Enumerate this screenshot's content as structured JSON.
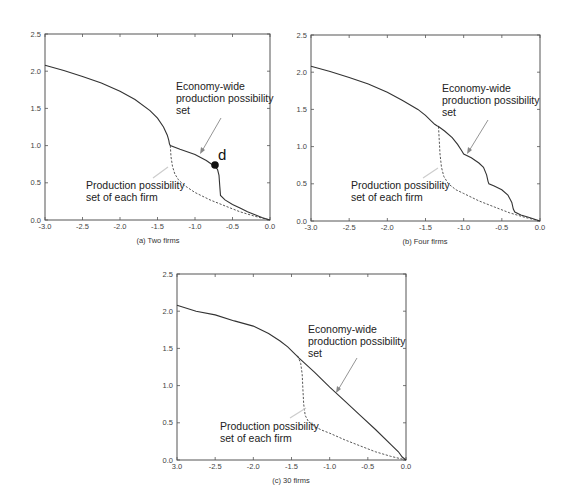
{
  "figure": {
    "panels": [
      {
        "id": "a",
        "caption": "(a) Two firms",
        "annotation_top": [
          "Economy-wide",
          "production possibility",
          "set"
        ],
        "annotation_bottom": [
          "Production possibility",
          "set of each firm"
        ],
        "point_label": "d",
        "x_tick_labels": [
          "-3.0",
          "-2.5",
          "-2.0",
          "-1.5",
          "-1.0",
          "-0.5",
          "0.0"
        ],
        "y_tick_labels": [
          "0.0",
          "0.5",
          "1.0",
          "1.5",
          "2.0",
          "2.5"
        ]
      },
      {
        "id": "b",
        "caption": "(b) Four firms",
        "annotation_top": [
          "Economy-wide",
          "production possibility",
          "set"
        ],
        "annotation_bottom": [
          "Production possibility",
          "set of each firm"
        ],
        "x_tick_labels": [
          "-3.0",
          "-2.5",
          "-2.0",
          "-1.5",
          "-1.0",
          "-0.5",
          "0.0"
        ],
        "y_tick_labels": [
          "0.0",
          "0.5",
          "1.0",
          "1.5",
          "2.0",
          "2.5"
        ]
      },
      {
        "id": "c",
        "caption": "(c) 30 firms",
        "annotation_top": [
          "Economy-wide",
          "production possibility",
          "set"
        ],
        "annotation_bottom": [
          "Production possibility",
          "set of each firm"
        ],
        "x_tick_labels": [
          "3.0",
          "-2.5",
          "-2.0",
          "-1.5",
          "-1.0",
          "-0.5",
          "0.0"
        ],
        "y_tick_labels": [
          "0.0",
          "0.5",
          "1.0",
          "1.5",
          "2.0",
          "2.5"
        ]
      }
    ]
  },
  "chart_data": [
    {
      "type": "line",
      "title": "(a) Two firms",
      "xlabel": "",
      "ylabel": "",
      "xlim": [
        -3.0,
        0.0
      ],
      "ylim": [
        0.0,
        2.5
      ],
      "grid": false,
      "series": [
        {
          "name": "Economy-wide production possibility set",
          "style": "solid",
          "x": [
            -3.0,
            -2.75,
            -2.5,
            -2.25,
            -2.0,
            -1.8,
            -1.6,
            -1.5,
            -1.42,
            -1.37,
            -1.35,
            -1.34,
            -1.33,
            -1.2,
            -1.0,
            -0.85,
            -0.75,
            -0.7,
            -0.68,
            -0.67,
            -0.66,
            -0.6,
            -0.5,
            -0.4,
            -0.3,
            -0.2,
            -0.1,
            0.0
          ],
          "y": [
            2.08,
            2.01,
            1.93,
            1.84,
            1.73,
            1.62,
            1.47,
            1.37,
            1.25,
            1.14,
            1.07,
            1.02,
            1.0,
            0.95,
            0.88,
            0.8,
            0.73,
            0.68,
            0.6,
            0.45,
            0.33,
            0.27,
            0.21,
            0.16,
            0.11,
            0.07,
            0.03,
            0.0
          ]
        },
        {
          "name": "Production possibility set of each firm",
          "style": "dashed",
          "x": [
            -1.33,
            -1.32,
            -1.3,
            -1.27,
            -1.22,
            -1.15,
            -1.0,
            -0.8,
            -0.6,
            -0.4,
            -0.2,
            0.0
          ],
          "y": [
            1.0,
            0.85,
            0.72,
            0.62,
            0.54,
            0.47,
            0.37,
            0.27,
            0.19,
            0.11,
            0.05,
            0.0
          ]
        }
      ],
      "annotations": [
        {
          "text": "Economy-wide production possibility set",
          "arrow_to": [
            -0.92,
            0.86
          ]
        },
        {
          "text": "Production possibility set of each firm",
          "arrow_to": [
            -1.33,
            0.72
          ]
        },
        {
          "text": "d",
          "point": [
            -0.74,
            0.73
          ]
        }
      ]
    },
    {
      "type": "line",
      "title": "(b) Four firms",
      "xlabel": "",
      "ylabel": "",
      "xlim": [
        -3.0,
        0.0
      ],
      "ylim": [
        0.0,
        2.5
      ],
      "grid": false,
      "series": [
        {
          "name": "Economy-wide production possibility set",
          "style": "solid",
          "x": [
            -3.0,
            -2.75,
            -2.5,
            -2.25,
            -2.0,
            -1.8,
            -1.6,
            -1.5,
            -1.42,
            -1.38,
            -1.35,
            -1.33,
            -1.25,
            -1.15,
            -1.08,
            -1.03,
            -1.0,
            -0.9,
            -0.8,
            -0.74,
            -0.7,
            -0.68,
            -0.67,
            -0.6,
            -0.5,
            -0.42,
            -0.37,
            -0.35,
            -0.33,
            -0.25,
            -0.15,
            0.0
          ],
          "y": [
            2.08,
            2.01,
            1.93,
            1.84,
            1.73,
            1.62,
            1.5,
            1.42,
            1.34,
            1.3,
            1.28,
            1.27,
            1.21,
            1.12,
            1.03,
            0.95,
            0.9,
            0.85,
            0.78,
            0.72,
            0.62,
            0.53,
            0.5,
            0.47,
            0.42,
            0.35,
            0.25,
            0.16,
            0.12,
            0.08,
            0.05,
            0.0
          ]
        },
        {
          "name": "Production possibility set of each firm",
          "style": "dashed",
          "x": [
            -1.33,
            -1.32,
            -1.31,
            -1.29,
            -1.26,
            -1.2,
            -1.1,
            -1.0,
            -0.8,
            -0.6,
            -0.4,
            -0.2,
            0.0
          ],
          "y": [
            1.27,
            1.1,
            0.9,
            0.72,
            0.6,
            0.5,
            0.42,
            0.37,
            0.27,
            0.19,
            0.11,
            0.05,
            0.0
          ]
        }
      ],
      "annotations": [
        {
          "text": "Economy-wide production possibility set",
          "arrow_to": [
            -0.96,
            0.92
          ]
        },
        {
          "text": "Production possibility set of each firm",
          "arrow_to": [
            -1.33,
            0.72
          ]
        }
      ]
    },
    {
      "type": "line",
      "title": "(c) 30 firms",
      "xlabel": "",
      "ylabel": "",
      "xlim": [
        -3.0,
        0.0
      ],
      "ylim": [
        0.0,
        2.5
      ],
      "grid": false,
      "series": [
        {
          "name": "Economy-wide production possibility set",
          "style": "solid",
          "x": [
            -3.0,
            -2.75,
            -2.5,
            -2.25,
            -2.0,
            -1.8,
            -1.65,
            -1.55,
            -1.45,
            -1.4,
            -1.2,
            -1.0,
            -0.8,
            -0.6,
            -0.4,
            -0.2,
            -0.1,
            -0.05,
            0.0
          ],
          "y": [
            2.08,
            2.0,
            1.95,
            1.87,
            1.8,
            1.7,
            1.6,
            1.52,
            1.42,
            1.37,
            1.18,
            0.98,
            0.79,
            0.6,
            0.41,
            0.21,
            0.11,
            0.04,
            0.0
          ]
        },
        {
          "name": "Production possibility set of each firm",
          "style": "dashed",
          "x": [
            -1.42,
            -1.38,
            -1.36,
            -1.35,
            -1.34,
            -1.32,
            -1.28,
            -1.2,
            -1.1,
            -1.0,
            -0.8,
            -0.6,
            -0.4,
            -0.2,
            0.0
          ],
          "y": [
            1.4,
            1.3,
            1.15,
            0.95,
            0.75,
            0.6,
            0.52,
            0.45,
            0.4,
            0.36,
            0.27,
            0.19,
            0.11,
            0.05,
            0.0
          ]
        }
      ],
      "annotations": [
        {
          "text": "Economy-wide production possibility set",
          "arrow_to": [
            -0.92,
            0.88
          ]
        },
        {
          "text": "Production possibility set of each firm",
          "arrow_to": [
            -1.28,
            0.72
          ]
        }
      ]
    }
  ]
}
